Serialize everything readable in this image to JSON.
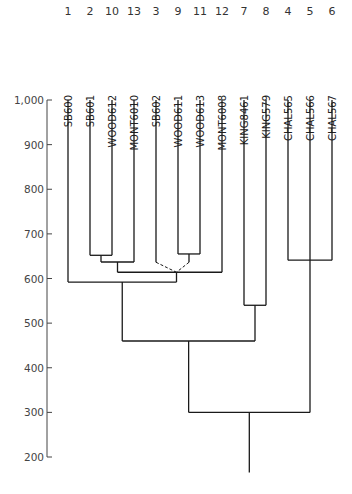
{
  "chart_data": {
    "type": "dendrogram",
    "title": "",
    "xlabel": "",
    "ylabel": "",
    "ylim": [
      200,
      1000
    ],
    "yticks": [
      1000,
      900,
      800,
      700,
      600,
      500,
      400,
      300,
      200
    ],
    "ytick_labels": [
      "1,000",
      "900",
      "800",
      "700",
      "600",
      "500",
      "400",
      "300",
      "200"
    ],
    "grid": false,
    "leaves": [
      {
        "index": "1",
        "label": "SB600"
      },
      {
        "index": "2",
        "label": "SB601"
      },
      {
        "index": "10",
        "label": "WOOD612"
      },
      {
        "index": "13",
        "label": "MONT6010"
      },
      {
        "index": "3",
        "label": "SB602"
      },
      {
        "index": "9",
        "label": "WOOD611"
      },
      {
        "index": "11",
        "label": "WOOD613"
      },
      {
        "index": "12",
        "label": "MONT6008"
      },
      {
        "index": "7",
        "label": "KING8461"
      },
      {
        "index": "8",
        "label": "KING579"
      },
      {
        "index": "4",
        "label": "CHAL565"
      },
      {
        "index": "5",
        "label": "CHAL566"
      },
      {
        "index": "6",
        "label": "CHAL567"
      }
    ],
    "merges": [
      {
        "id": "A",
        "children": [
          "SB601",
          "WOOD612"
        ],
        "height": 652
      },
      {
        "id": "B",
        "children": [
          "A",
          "MONT6010"
        ],
        "height": 637
      },
      {
        "id": "C",
        "children": [
          "WOOD611",
          "WOOD613"
        ],
        "height": 655
      },
      {
        "id": "D",
        "children": [
          "SB602",
          "C"
        ],
        "height": 614,
        "style": "dashed"
      },
      {
        "id": "E",
        "children": [
          "B",
          "D",
          "MONT6008"
        ],
        "height": 614
      },
      {
        "id": "F",
        "children": [
          "SB600",
          "E"
        ],
        "height": 592
      },
      {
        "id": "G",
        "children": [
          "KING8461",
          "KING579"
        ],
        "height": 540
      },
      {
        "id": "H",
        "children": [
          "F",
          "G"
        ],
        "height": 460
      },
      {
        "id": "I",
        "children": [
          "CHAL565",
          "CHAL567"
        ],
        "height": 641,
        "trunk": "CHAL566"
      },
      {
        "id": "root",
        "children": [
          "H",
          "CHAL566"
        ],
        "height": 300
      }
    ],
    "root_stem_end": 165
  }
}
